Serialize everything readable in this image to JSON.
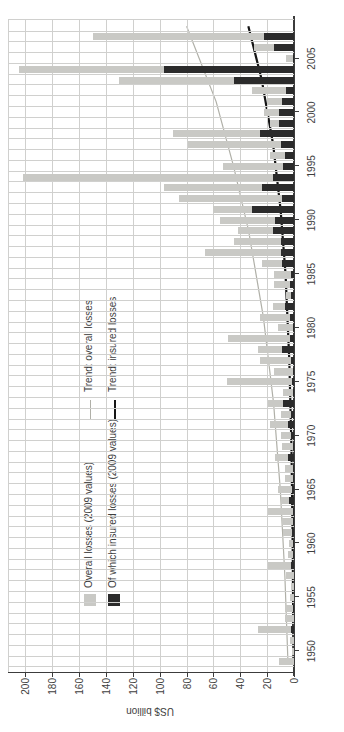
{
  "axis": {
    "y_label": "US$ billion",
    "y_ticks": [
      0,
      20,
      40,
      60,
      80,
      100,
      120,
      140,
      160,
      180,
      200
    ],
    "y_max_visible": 213,
    "x_tick_years": [
      1950,
      1955,
      1960,
      1965,
      1970,
      1975,
      1980,
      1985,
      1990,
      1995,
      2000,
      2005
    ]
  },
  "legend": {
    "overall": "Overall losses (2009 values)",
    "insured": "Of which insured losses (2009 values)",
    "trend_overall": "Trend: overall losses",
    "trend_insured": "Trend: insured losses"
  },
  "colors": {
    "overall_bar": "#c9c9c5",
    "insured_bar": "#2b2b2b",
    "trend_overall": "#b0b0a8",
    "trend_insured": "#161616",
    "gridline": "#d0d0ce",
    "axis": "#3c3c3c",
    "text": "#3e3e3e"
  },
  "chart_data": {
    "type": "bar",
    "note_orientation": "landscape chart rotated 90 degrees counter-clockwise in the screenshot",
    "title": "",
    "xlabel": "",
    "ylabel": "US$ billion",
    "ylim": [
      0,
      213
    ],
    "grid": "on",
    "legend_position": "inside-top-left",
    "categories": [
      1950,
      1951,
      1952,
      1953,
      1954,
      1955,
      1956,
      1957,
      1958,
      1959,
      1960,
      1961,
      1962,
      1963,
      1964,
      1965,
      1966,
      1967,
      1968,
      1969,
      1970,
      1971,
      1972,
      1973,
      1974,
      1975,
      1976,
      1977,
      1978,
      1979,
      1980,
      1981,
      1982,
      1983,
      1984,
      1985,
      1986,
      1987,
      1988,
      1989,
      1990,
      1991,
      1992,
      1993,
      1994,
      1995,
      1996,
      1997,
      1998,
      1999,
      2000,
      2001,
      2002,
      2003,
      2004,
      2005,
      2006,
      2007,
      2008
    ],
    "series": [
      {
        "name": "Overall losses (2009 values)",
        "values": [
          11,
          1.5,
          3,
          27,
          7,
          7,
          3,
          2,
          6,
          19,
          4.5,
          4,
          8,
          9,
          19,
          10,
          12,
          7,
          7,
          14,
          9,
          10,
          18,
          10,
          19,
          8,
          50,
          15,
          25,
          27,
          49,
          12,
          25,
          16,
          6,
          15,
          15,
          24,
          66,
          45,
          42,
          55,
          60,
          86,
          97,
          202,
          53,
          18,
          79,
          90,
          18,
          22,
          20,
          31,
          130,
          205,
          6,
          30,
          150
        ]
      },
      {
        "name": "Of which insured losses (2009 values)",
        "values": [
          0,
          0,
          0,
          2.5,
          0,
          0.5,
          0,
          0,
          0,
          2,
          1,
          0.5,
          1.5,
          1,
          1,
          4,
          1.5,
          1,
          1,
          4.5,
          1,
          2,
          4.5,
          2,
          8,
          1,
          1.5,
          1,
          2,
          9,
          3,
          1,
          3,
          7,
          2,
          3,
          2,
          9,
          10,
          10,
          16,
          14,
          31,
          9,
          24,
          16,
          8,
          7,
          10,
          25,
          11,
          11,
          9,
          6,
          45,
          97,
          1,
          15,
          22
        ]
      }
    ],
    "trend_lines": [
      {
        "name": "Trend: overall losses",
        "points": [
          [
            1950,
            4.5
          ],
          [
            1958,
            6.8
          ],
          [
            1966,
            10.2
          ],
          [
            1974,
            15.2
          ],
          [
            1982,
            22.8
          ],
          [
            1990,
            33.8
          ],
          [
            1996,
            45.0
          ],
          [
            2002,
            58.0
          ],
          [
            2009,
            80.0
          ]
        ]
      },
      {
        "name": "Trend: insured losses",
        "points": [
          [
            1950,
            0.4
          ],
          [
            1960,
            0.9
          ],
          [
            1970,
            1.9
          ],
          [
            1978,
            3.5
          ],
          [
            1986,
            6.3
          ],
          [
            1992,
            10.0
          ],
          [
            1998,
            15.5
          ],
          [
            2004,
            24.0
          ],
          [
            2009,
            34.0
          ]
        ]
      }
    ]
  }
}
